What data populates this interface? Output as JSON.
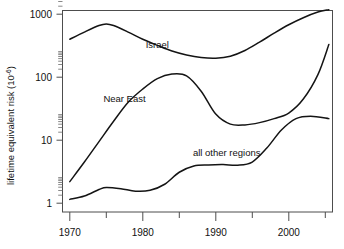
{
  "chart_data": {
    "type": "line",
    "title": "",
    "xlabel": "",
    "ylabel": "lifetime equivalent risk (10",
    "ylabel_superscript": "-6",
    "ylabel_suffix": ")",
    "xlim": [
      1969,
      2006
    ],
    "ylim": [
      1,
      2000
    ],
    "yscale": "log",
    "grid": false,
    "legend_position": "inline-annotations",
    "x_ticks_major": [
      1970,
      1980,
      1990,
      2000
    ],
    "x_tick_labels": [
      "1970",
      "1980",
      "1990",
      "2000"
    ],
    "x_ticks_minor": [
      1975,
      1985,
      1995,
      2005
    ],
    "y_ticks_major": [
      1,
      10,
      100,
      1000
    ],
    "y_tick_labels": [
      "1",
      "10",
      "100",
      "1000"
    ],
    "series": [
      {
        "name": "Israel",
        "label": "Israel",
        "label_x": 1982,
        "label_y": 330,
        "x": [
          1970,
          1972,
          1974,
          1975,
          1976,
          1978,
          1980,
          1982,
          1984,
          1986,
          1988,
          1990,
          1992,
          1994,
          1996,
          1998,
          2000,
          2002,
          2004,
          2005.5
        ],
        "values": [
          400,
          520,
          660,
          700,
          660,
          520,
          400,
          320,
          260,
          225,
          205,
          200,
          215,
          265,
          360,
          500,
          680,
          880,
          1080,
          1180
        ]
      },
      {
        "name": "Near East",
        "label": "Near East",
        "label_x": 1977.5,
        "label_y": 46,
        "x": [
          1970,
          1972,
          1974,
          1976,
          1978,
          1980,
          1982,
          1984,
          1986,
          1988,
          1990,
          1992,
          1994,
          1996,
          1998,
          2000,
          2002,
          2004,
          2005.5
        ],
        "values": [
          2.2,
          4.5,
          9.5,
          20,
          40,
          65,
          95,
          112,
          105,
          60,
          26,
          18,
          17.5,
          19,
          22,
          27,
          45,
          110,
          330
        ]
      },
      {
        "name": "all other regions",
        "label": "all other regions",
        "label_x": 1991.5,
        "label_y": 6.4,
        "x": [
          1970,
          1972,
          1974,
          1975,
          1977,
          1979,
          1981,
          1983,
          1985,
          1987,
          1989,
          1991,
          1993,
          1995,
          1997,
          1999,
          2001,
          2003,
          2005.5
        ],
        "values": [
          1.15,
          1.3,
          1.65,
          1.78,
          1.7,
          1.55,
          1.6,
          2.0,
          3.1,
          3.9,
          4.05,
          4.1,
          4.0,
          4.5,
          7.5,
          14.5,
          22,
          24,
          22
        ]
      }
    ]
  },
  "figure": {
    "background_color": "#ffffff",
    "line_color": "#141414",
    "axis_color": "#4d4d4d"
  }
}
